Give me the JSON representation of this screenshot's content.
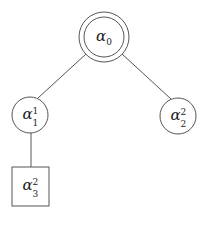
{
  "diagram": {
    "type": "tree",
    "nodes": [
      {
        "id": "root",
        "symbol": "α",
        "sub": "0",
        "sup": "",
        "shape": "double-circle"
      },
      {
        "id": "left",
        "symbol": "α",
        "sub": "1",
        "sup": "1",
        "shape": "circle"
      },
      {
        "id": "right",
        "symbol": "α",
        "sub": "2",
        "sup": "2",
        "shape": "circle"
      },
      {
        "id": "leaf",
        "symbol": "α",
        "sub": "3",
        "sup": "2",
        "shape": "square"
      }
    ],
    "edges": [
      {
        "from": "root",
        "to": "left"
      },
      {
        "from": "root",
        "to": "right"
      },
      {
        "from": "left",
        "to": "leaf"
      }
    ]
  }
}
